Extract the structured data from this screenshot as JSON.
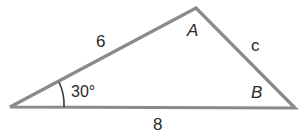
{
  "diagram": {
    "type": "triangle",
    "colors": {
      "line": "#8a8a8a",
      "text": "#2a2a2a",
      "background": "#ffffff"
    },
    "vertices": {
      "left": {
        "label": ""
      },
      "top": {
        "label": "A"
      },
      "right": {
        "label": "B"
      }
    },
    "sides": {
      "left_top": {
        "label": "6"
      },
      "top_right": {
        "label": "c"
      },
      "base": {
        "label": "8"
      }
    },
    "angles": {
      "left": {
        "label": "30°"
      }
    }
  }
}
